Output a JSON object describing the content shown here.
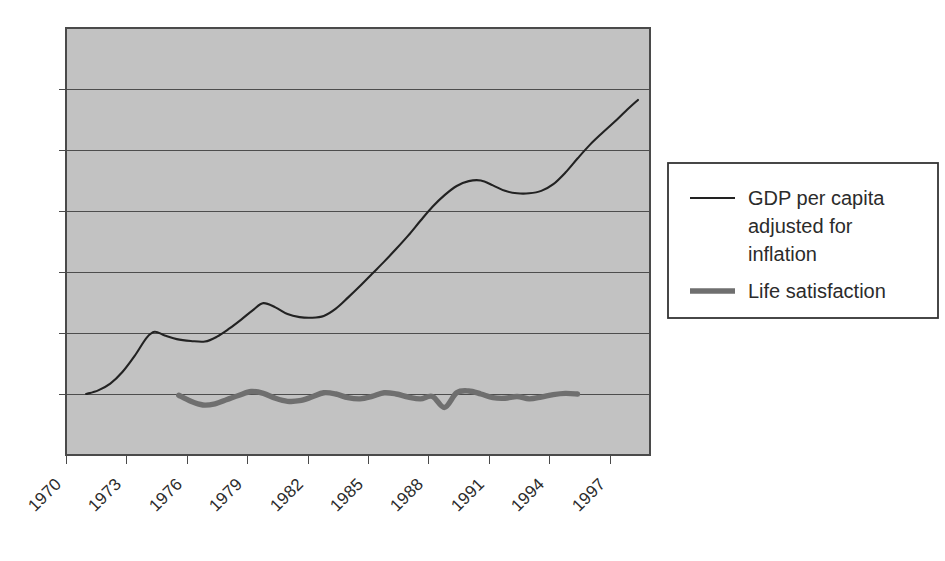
{
  "chart_data": {
    "type": "line",
    "title": "",
    "subtitle": "",
    "xlabel": "",
    "ylabel": "",
    "grid": true,
    "legend_position": "right",
    "xlim": [
      1970,
      1999
    ],
    "x_tick_labels": [
      "1970",
      "1973",
      "1976",
      "1979",
      "1982",
      "1985",
      "1988",
      "1991",
      "1994",
      "1997"
    ],
    "x_tick_values": [
      1970,
      1973,
      1976,
      1979,
      1982,
      1985,
      1988,
      1991,
      1994,
      1997
    ],
    "y_tick_labels": [],
    "ylim": [
      -1,
      6
    ],
    "y_gridline_values": [
      0,
      1,
      2,
      3,
      4,
      5
    ],
    "plot_background_color": "#c2c2c2",
    "series": [
      {
        "name": "GDP per capita adjusted for inflation",
        "color": "#222222",
        "line_width": "thin",
        "x": [
          1971.0,
          1971.6,
          1972.2,
          1972.8,
          1973.4,
          1974.0,
          1974.4,
          1974.9,
          1975.5,
          1976.2,
          1976.9,
          1977.5,
          1978.1,
          1978.7,
          1979.3,
          1979.8,
          1980.4,
          1981.0,
          1981.6,
          1982.2,
          1982.8,
          1983.4,
          1984.0,
          1984.6,
          1985.2,
          1985.8,
          1986.4,
          1987.0,
          1987.6,
          1988.2,
          1988.8,
          1989.4,
          1990.0,
          1990.6,
          1991.2,
          1991.8,
          1992.4,
          1993.0,
          1993.6,
          1994.2,
          1994.8,
          1995.4,
          1996.0,
          1996.6,
          1997.2,
          1997.8,
          1998.4
        ],
        "y": [
          0.0,
          0.06,
          0.17,
          0.36,
          0.62,
          0.92,
          1.02,
          0.96,
          0.9,
          0.87,
          0.86,
          0.94,
          1.07,
          1.22,
          1.38,
          1.49,
          1.42,
          1.31,
          1.26,
          1.25,
          1.28,
          1.4,
          1.58,
          1.77,
          1.97,
          2.17,
          2.38,
          2.6,
          2.84,
          3.07,
          3.26,
          3.41,
          3.49,
          3.5,
          3.42,
          3.33,
          3.29,
          3.29,
          3.33,
          3.44,
          3.63,
          3.86,
          4.08,
          4.27,
          4.45,
          4.64,
          4.82
        ]
      },
      {
        "name": "Life satisfaction",
        "color": "#6f6f6f",
        "line_width": "thick",
        "x": [
          1975.6,
          1976.2,
          1976.8,
          1977.4,
          1978.0,
          1978.6,
          1979.2,
          1979.8,
          1980.4,
          1981.0,
          1981.6,
          1982.2,
          1982.8,
          1983.4,
          1984.0,
          1984.6,
          1985.2,
          1985.8,
          1986.4,
          1987.0,
          1987.6,
          1988.2,
          1988.8,
          1989.4,
          1990.0,
          1990.6,
          1991.2,
          1991.8,
          1992.4,
          1993.0,
          1993.6,
          1994.2,
          1994.8,
          1995.4
        ],
        "y": [
          -0.02,
          -0.12,
          -0.18,
          -0.16,
          -0.09,
          -0.02,
          0.04,
          0.01,
          -0.07,
          -0.12,
          -0.11,
          -0.05,
          0.02,
          0.0,
          -0.06,
          -0.08,
          -0.04,
          0.02,
          0.0,
          -0.05,
          -0.08,
          -0.04,
          -0.22,
          0.02,
          0.05,
          0.0,
          -0.06,
          -0.07,
          -0.04,
          -0.08,
          -0.05,
          -0.01,
          0.01,
          0.0
        ]
      }
    ]
  },
  "legend": {
    "entries": [
      {
        "id": "gdp",
        "swatch": "thin-line-swatch",
        "lines": [
          "GDP per capita",
          "adjusted for",
          "inflation"
        ],
        "color": "#222222"
      },
      {
        "id": "life",
        "swatch": "thick-line-swatch",
        "lines": [
          "Life satisfaction"
        ],
        "color": "#6f6f6f"
      }
    ]
  }
}
